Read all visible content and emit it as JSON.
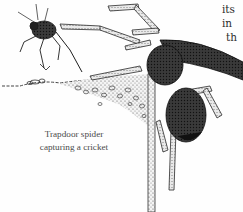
{
  "figure": {
    "subject": "trapdoor spider capturing a cricket",
    "caption_lines": [
      "Trapdoor spider",
      "capturing a cricket"
    ],
    "colors": {
      "ink": "#1e1e1e",
      "ink_light": "#6a6a6a",
      "paper": "#fefefe",
      "caption_text": "#4a4a4a"
    }
  },
  "body_text": {
    "lines": [
      "its",
      "in",
      "th"
    ]
  }
}
